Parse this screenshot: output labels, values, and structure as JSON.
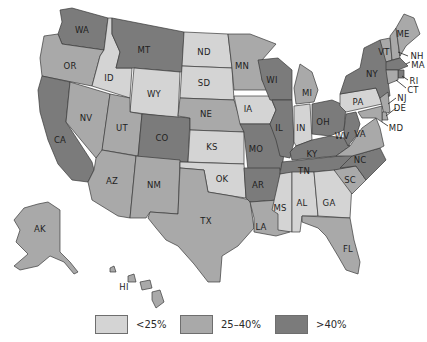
{
  "map": {
    "type": "choropleth",
    "region": "United States",
    "tiers": {
      "low": {
        "label": "<25%",
        "color": "#d4d4d4"
      },
      "mid": {
        "label": "25–40%",
        "color": "#a9a9a9"
      },
      "high": {
        "label": ">40%",
        "color": "#7b7b7b"
      }
    },
    "states": {
      "WA": "high",
      "OR": "mid",
      "CA": "high",
      "ID": "low",
      "NV": "mid",
      "MT": "high",
      "WY": "low",
      "UT": "mid",
      "AZ": "mid",
      "CO": "high",
      "NM": "mid",
      "ND": "low",
      "SD": "low",
      "NE": "mid",
      "KS": "low",
      "OK": "low",
      "TX": "mid",
      "MN": "mid",
      "IA": "low",
      "MO": "high",
      "AR": "high",
      "LA": "mid",
      "WI": "high",
      "IL": "high",
      "MI": "mid",
      "IN": "low",
      "OH": "high",
      "KY": "high",
      "TN": "high",
      "MS": "low",
      "AL": "low",
      "GA": "low",
      "FL": "mid",
      "SC": "mid",
      "NC": "high",
      "VA": "mid",
      "WV": "high",
      "PA": "low",
      "NY": "high",
      "VT": "mid",
      "NH": "mid",
      "ME": "mid",
      "MA": "high",
      "RI": "high",
      "CT": "mid",
      "NJ": "mid",
      "DE": "mid",
      "MD": "mid",
      "AK": "mid",
      "HI": "mid"
    },
    "labels": {
      "WA": "WA",
      "OR": "OR",
      "CA": "CA",
      "ID": "ID",
      "NV": "NV",
      "MT": "MT",
      "WY": "WY",
      "UT": "UT",
      "AZ": "AZ",
      "CO": "CO",
      "NM": "NM",
      "ND": "ND",
      "SD": "SD",
      "NE": "NE",
      "KS": "KS",
      "OK": "OK",
      "TX": "TX",
      "MN": "MN",
      "IA": "IA",
      "MO": "MO",
      "AR": "AR",
      "LA": "LA",
      "WI": "WI",
      "IL": "IL",
      "MI": "MI",
      "IN": "IN",
      "OH": "OH",
      "KY": "KY",
      "TN": "TN",
      "MS": "MS",
      "AL": "AL",
      "GA": "GA",
      "FL": "FL",
      "SC": "SC",
      "NC": "NC",
      "VA": "VA",
      "WV": "WV",
      "PA": "PA",
      "NY": "NY",
      "VT": "VT",
      "NH": "NH",
      "ME": "ME",
      "MA": "MA",
      "RI": "RI",
      "CT": "CT",
      "NJ": "NJ",
      "DE": "DE",
      "MD": "MD",
      "AK": "AK",
      "HI": "HI"
    }
  },
  "legend": {
    "items": [
      {
        "label": "<25%",
        "color": "#d4d4d4"
      },
      {
        "label": "25–40%",
        "color": "#a9a9a9"
      },
      {
        "label": ">40%",
        "color": "#7b7b7b"
      }
    ]
  }
}
